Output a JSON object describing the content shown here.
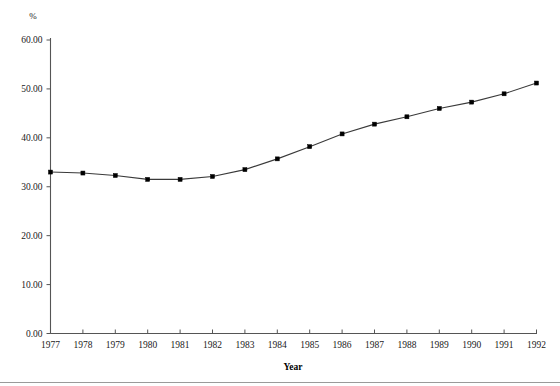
{
  "chart_data": {
    "type": "line",
    "title": "",
    "subtitle": "",
    "xlabel": "Year",
    "ylabel": "%",
    "unit_label": "%",
    "categories": [
      "1977",
      "1978",
      "1979",
      "1980",
      "1981",
      "1982",
      "1983",
      "1984",
      "1985",
      "1986",
      "1987",
      "1988",
      "1989",
      "1990",
      "1991",
      "1992"
    ],
    "x": [
      1977,
      1978,
      1979,
      1980,
      1981,
      1982,
      1983,
      1984,
      1985,
      1986,
      1987,
      1988,
      1989,
      1990,
      1991,
      1992
    ],
    "values": [
      33.0,
      32.8,
      32.3,
      31.5,
      31.5,
      32.1,
      33.5,
      35.7,
      38.2,
      40.8,
      42.8,
      44.3,
      46.0,
      47.3,
      49.0,
      51.2
    ],
    "series": [
      {
        "name": "",
        "values": [
          33.0,
          32.8,
          32.3,
          31.5,
          31.5,
          32.1,
          33.5,
          35.7,
          38.2,
          40.8,
          42.8,
          44.3,
          46.0,
          47.3,
          49.0,
          51.2
        ]
      }
    ],
    "ylim": [
      0,
      60
    ],
    "ytick_labels": [
      "0.00",
      "10.00",
      "20.00",
      "30.00",
      "40.00",
      "50.00",
      "60.00"
    ],
    "ytick_values": [
      0,
      10,
      20,
      30,
      40,
      50,
      60
    ],
    "xtick_labels": [
      "1977",
      "1978",
      "1979",
      "1980",
      "1981",
      "1982",
      "1983",
      "1984",
      "1985",
      "1986",
      "1987",
      "1988",
      "1989",
      "1990",
      "1991",
      "1992"
    ],
    "grid": false,
    "legend": false,
    "legend_position": "none",
    "marker": "square",
    "line_color": "#3a3a3a",
    "marker_color": "#000000",
    "axis_color": "#555555",
    "background_color": "#ffffff"
  },
  "labels": {
    "y_unit": "%",
    "x_axis_title": "Year"
  }
}
